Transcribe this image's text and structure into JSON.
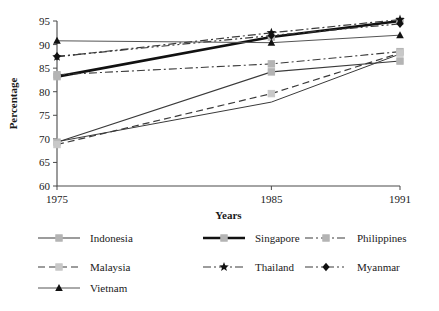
{
  "chart_data": {
    "type": "line",
    "title": "",
    "xlabel": "Years",
    "ylabel": "Percentage",
    "x": [
      1975,
      1985,
      1991
    ],
    "categories": [
      "1975",
      "1985",
      "1991"
    ],
    "xtick_labels": [
      "1975",
      "1985",
      "1991"
    ],
    "ytick_labels": [
      "60",
      "65",
      "70",
      "75",
      "80",
      "85",
      "90",
      "95"
    ],
    "yticks": [
      60,
      65,
      70,
      75,
      80,
      85,
      90,
      95
    ],
    "ylim": [
      60,
      95
    ],
    "xlim": [
      1975,
      1991
    ],
    "grid": false,
    "legend_position": "bottom",
    "series": [
      {
        "name": "Indonesia",
        "values": [
          69.3,
          84.2,
          86.5
        ],
        "marker": "square",
        "dash": "solid",
        "color": "#3a3a3a",
        "marker_color": "#b4b4b4",
        "width": 1.1
      },
      {
        "name": "Singapore",
        "values": [
          83.2,
          91.6,
          95.0
        ],
        "marker": "square",
        "dash": "solid",
        "color": "#111111",
        "marker_color": "#b4b4b4",
        "width": 2.6
      },
      {
        "name": "Philippines",
        "values": [
          83.6,
          85.9,
          88.5
        ],
        "marker": "square",
        "dash": "dashdot",
        "color": "#3a3a3a",
        "marker_color": "#b4b4b4",
        "width": 1.1
      },
      {
        "name": "Malaysia",
        "values": [
          68.8,
          79.6,
          88.2
        ],
        "marker": "square",
        "dash": "dashed",
        "color": "#3a3a3a",
        "marker_color": "#c8c8c8",
        "width": 1.2
      },
      {
        "name": "Thailand",
        "values": [
          87.4,
          92.5,
          95.3
        ],
        "marker": "star",
        "dash": "dashdot",
        "color": "#3a3a3a",
        "marker_color": "#111111",
        "width": 1.2
      },
      {
        "name": "Myanmar",
        "values": [
          87.5,
          91.9,
          94.4
        ],
        "marker": "diamond",
        "dash": "dashdotdot",
        "color": "#3a3a3a",
        "marker_color": "#111111",
        "width": 1.2
      },
      {
        "name": "Vietnam",
        "values": [
          90.8,
          90.4,
          92.0
        ],
        "marker": "triangle",
        "dash": "solid",
        "color": "#555555",
        "marker_color": "#111111",
        "width": 1.0
      }
    ],
    "extra_series": [
      {
        "name": "Vietnam-lower",
        "values": [
          69.4,
          77.8,
          88.0
        ],
        "marker": "none",
        "dash": "solid",
        "color": "#3a3a3a",
        "width": 1.0
      }
    ]
  },
  "legend": {
    "entries": [
      {
        "label": "Indonesia"
      },
      {
        "label": "Singapore"
      },
      {
        "label": "Philippines"
      },
      {
        "label": "Malaysia"
      },
      {
        "label": "Thailand"
      },
      {
        "label": "Myanmar"
      },
      {
        "label": "Vietnam"
      }
    ]
  },
  "axes": {
    "ylabel": "Percentage",
    "xlabel": "Years"
  }
}
